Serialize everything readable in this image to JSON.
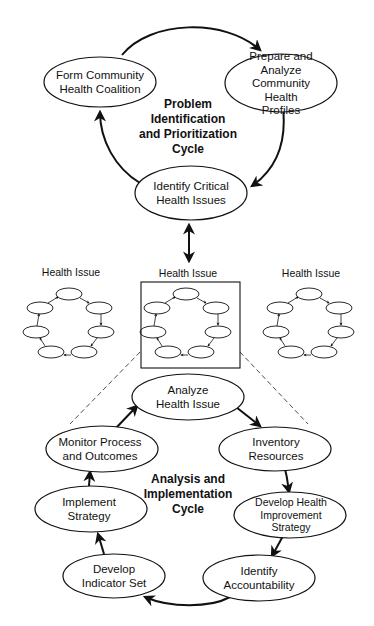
{
  "diagram": {
    "top_cycle": {
      "title": "Problem\nIdentification\nand Prioritization\nCycle",
      "nodes": [
        {
          "label": "Form Community\nHealth Coalition"
        },
        {
          "label": "Prepare and Analyze\nCommunity Health\nProfiles"
        },
        {
          "label": "Identify Critical\nHealth Issues"
        }
      ]
    },
    "health_issues": [
      {
        "label": "Health Issue"
      },
      {
        "label": "Health Issue"
      },
      {
        "label": "Health Issue"
      }
    ],
    "bottom_cycle": {
      "title": "Analysis and\nImplementation\nCycle",
      "nodes": [
        {
          "label": "Analyze\nHealth Issue"
        },
        {
          "label": "Inventory Resources"
        },
        {
          "label": "Develop Health\nImprovement Strategy"
        },
        {
          "label": "Identify\nAccountability"
        },
        {
          "label": "Develop\nIndicator Set"
        },
        {
          "label": "Implement\nStrategy"
        },
        {
          "label": "Monitor Process\nand Outcomes"
        }
      ]
    },
    "colors": {
      "stroke": "#111111",
      "background": "#ffffff"
    }
  }
}
